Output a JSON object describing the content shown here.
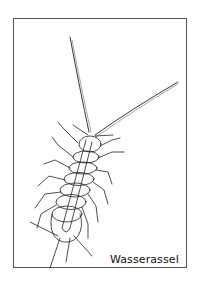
{
  "card": {
    "caption": "Wasserassel",
    "illustration": "water-louse-line-drawing",
    "border_color": "#555555",
    "line_color": "#222222"
  }
}
